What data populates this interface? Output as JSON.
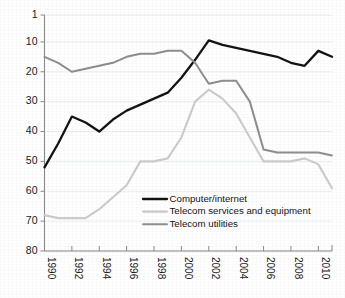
{
  "chart_data": {
    "type": "line",
    "title": "",
    "subtitle": "",
    "xlabel": "",
    "ylabel": "",
    "axis_inverted_y": true,
    "grid": true,
    "legend_position": "inside-bottom-center",
    "xlim": [
      1990,
      2011
    ],
    "ylim": [
      80,
      1
    ],
    "x_tick_labels": [
      "1990",
      "1992",
      "1994",
      "1996",
      "1998",
      "2000",
      "2002",
      "2004",
      "2006",
      "2008",
      "2010"
    ],
    "x_tick_values": [
      1990,
      1992,
      1994,
      1996,
      1998,
      2000,
      2002,
      2004,
      2006,
      2008,
      2010
    ],
    "y_tick_labels": [
      "1",
      "10",
      "20",
      "30",
      "40",
      "50",
      "60",
      "70",
      "80"
    ],
    "y_tick_values": [
      1,
      10,
      20,
      30,
      40,
      50,
      60,
      70,
      80
    ],
    "x": [
      1990,
      1991,
      1992,
      1993,
      1994,
      1995,
      1996,
      1997,
      1998,
      1999,
      2000,
      2001,
      2002,
      2003,
      2004,
      2005,
      2006,
      2007,
      2008,
      2009,
      2010,
      2011
    ],
    "series": [
      {
        "name": "Computer/internet",
        "color": "#141414",
        "width": 2.3,
        "values": [
          52,
          44,
          35,
          37,
          40,
          36,
          33,
          31,
          29,
          27,
          22,
          16,
          9.5,
          11,
          12,
          13,
          14,
          15,
          17,
          18,
          13,
          15
        ]
      },
      {
        "name": "Telecom services and equipment",
        "color": "#cccccc",
        "width": 2.1,
        "values": [
          68,
          69,
          69,
          69,
          66,
          62,
          58,
          50,
          50,
          49,
          42,
          30,
          26,
          29,
          34,
          42,
          50,
          50,
          50,
          49,
          51,
          59
        ]
      },
      {
        "name": "Telecom utilities",
        "color": "#8e8e8e",
        "width": 2.0,
        "values": [
          15,
          17,
          20,
          19,
          18,
          17,
          15,
          14,
          14,
          13,
          13,
          17,
          24,
          23,
          23,
          30,
          46,
          47,
          47,
          47,
          47,
          48
        ]
      }
    ],
    "legend": [
      {
        "label": "Computer/internet",
        "color": "#141414"
      },
      {
        "label": "Telecom services and equipment",
        "color": "#cccccc"
      },
      {
        "label": "Telecom utilities",
        "color": "#8e8e8e"
      }
    ]
  }
}
